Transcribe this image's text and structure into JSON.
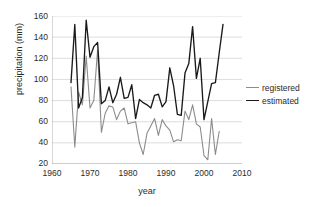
{
  "chart_data": {
    "type": "line",
    "title": "",
    "xlabel": "year",
    "ylabel": "precipitation (mm)",
    "xlim": [
      1960,
      2010
    ],
    "ylim": [
      20,
      160
    ],
    "xticks": [
      1960,
      1970,
      1980,
      1990,
      2000,
      2010
    ],
    "yticks": [
      20,
      40,
      60,
      80,
      100,
      120,
      140,
      160
    ],
    "grid": "horizontal",
    "legend_position": "right",
    "colors": {
      "registered": "#8c8c8c",
      "estimated": "#1a1a1a",
      "gridline": "#d4d4d4",
      "axis": "#a6a6a6",
      "text": "#2b2b2b",
      "background": "#ffffff"
    },
    "series": [
      {
        "name": "registered",
        "x": [
          1965,
          1966,
          1967,
          1968,
          1969,
          1970,
          1971,
          1972,
          1973,
          1974,
          1975,
          1976,
          1977,
          1978,
          1979,
          1980,
          1981,
          1982,
          1983,
          1984,
          1985,
          1986,
          1987,
          1988,
          1989,
          1990,
          1991,
          1992,
          1993,
          1994,
          1995,
          1996,
          1997,
          1998,
          1999,
          2000,
          2001,
          2002,
          2003,
          2004
        ],
        "values": [
          93,
          36,
          88,
          76,
          122,
          73,
          80,
          128,
          50,
          68,
          75,
          74,
          62,
          70,
          73,
          58,
          59,
          60,
          40,
          29,
          49,
          56,
          63,
          47,
          62,
          56,
          52,
          41,
          43,
          42,
          70,
          62,
          76,
          58,
          55,
          28,
          24,
          63,
          29,
          51
        ]
      },
      {
        "name": "estimated",
        "x": [
          1965,
          1966,
          1967,
          1968,
          1969,
          1970,
          1971,
          1972,
          1973,
          1974,
          1975,
          1976,
          1977,
          1978,
          1979,
          1980,
          1981,
          1982,
          1983,
          1984,
          1985,
          1986,
          1987,
          1988,
          1989,
          1990,
          1991,
          1992,
          1993,
          1994,
          1995,
          1996,
          1997,
          1998,
          1999,
          2000,
          2001,
          2002,
          2003,
          2004,
          2005
        ],
        "values": [
          97,
          152,
          73,
          83,
          156,
          121,
          131,
          135,
          77,
          80,
          93,
          78,
          86,
          102,
          82,
          83,
          95,
          63,
          81,
          78,
          76,
          73,
          85,
          86,
          74,
          79,
          111,
          94,
          67,
          66,
          106,
          115,
          150,
          101,
          120,
          62,
          79,
          96,
          97,
          125,
          152
        ]
      }
    ]
  },
  "legend": {
    "items": [
      {
        "label": "registered"
      },
      {
        "label": "estimated"
      }
    ]
  },
  "axes": {
    "y_tick_labels": [
      "160",
      "140",
      "120",
      "100",
      "80",
      "60",
      "40",
      "20"
    ],
    "x_tick_labels": [
      "1960",
      "1970",
      "1980",
      "1990",
      "2000",
      "2010"
    ]
  }
}
